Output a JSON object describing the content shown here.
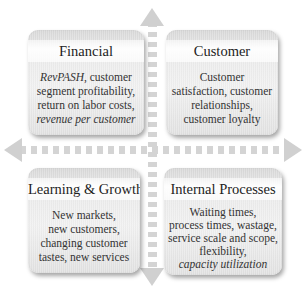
{
  "diagram": {
    "type": "four-quadrant balanced scorecard",
    "colors": {
      "box_fill": "#e9e9e9",
      "title_band": "#ffffff",
      "arrow": "#d0d0d0",
      "text": "#2a2a2a"
    },
    "quadrants": {
      "financial": {
        "title": "Financial",
        "lines": [
          {
            "pre_italic": "RevPASH",
            "text": ", customer"
          },
          {
            "text": "segment profitability,"
          },
          {
            "text": "return on labor costs,"
          },
          {
            "italic": "revenue per customer"
          }
        ]
      },
      "customer": {
        "title": "Customer",
        "lines": [
          {
            "text": "Customer"
          },
          {
            "text": "satisfaction, customer"
          },
          {
            "text": "relationships,"
          },
          {
            "text": "customer loyalty"
          }
        ]
      },
      "learning_growth": {
        "title": "Learning & Growth",
        "lines": [
          {
            "text": "New markets,"
          },
          {
            "text": "new customers,"
          },
          {
            "text": "changing customer"
          },
          {
            "text": "tastes, new services"
          }
        ]
      },
      "internal_processes": {
        "title": "Internal Processes",
        "lines": [
          {
            "text": "Waiting times,"
          },
          {
            "text": "process times, wastage,"
          },
          {
            "text": "service scale and scope,"
          },
          {
            "text": "flexibility,"
          },
          {
            "italic": "capacity utilization"
          }
        ]
      }
    },
    "axes": {
      "vertical": {
        "arrow_up": "arrow-up-icon",
        "arrow_down": "arrow-down-icon",
        "style": "dotted"
      },
      "horizontal": {
        "arrow_left": "arrow-left-icon",
        "arrow_right": "arrow-right-icon",
        "style": "dotted"
      }
    }
  }
}
